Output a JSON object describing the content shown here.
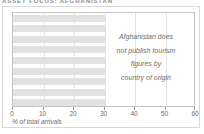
{
  "header": {
    "title": "ASSET FOCUS: AFGHANISTAN"
  },
  "chart_data": {
    "type": "bar",
    "orientation": "horizontal",
    "title": "",
    "subtitle": "",
    "xlabel": "% of total arrivals",
    "ylabel": "",
    "xlim": [
      0,
      60
    ],
    "xticks": [
      0,
      10,
      20,
      30,
      40,
      50,
      60
    ],
    "xtick_labels": [
      "0",
      "10",
      "20",
      "30",
      "40",
      "50",
      "60"
    ],
    "grid": true,
    "grid_axis": "x",
    "legend": false,
    "categories": [
      "",
      "",
      "",
      "",
      "",
      "",
      "",
      "",
      ""
    ],
    "values": [
      30,
      30,
      30,
      30,
      30,
      30,
      30,
      30,
      30
    ],
    "bar_color": "#e2e2e2",
    "annotation_lines": [
      "Afghanistan does",
      "not publish tourism",
      "figures by",
      "country of origin"
    ]
  },
  "colors": {
    "bar": "#e2e2e2",
    "grid": "#e3e3e3",
    "frame": "#c4c4c4",
    "card_border": "#d9d9d9",
    "axis_text": "#6b6b6b",
    "annotation_text": "#6e6e6e",
    "header_text": "#8c8c8c",
    "background": "#ffffff"
  }
}
